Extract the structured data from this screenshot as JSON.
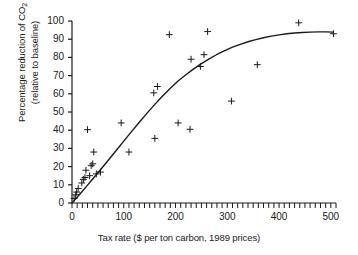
{
  "chart_data": {
    "type": "scatter",
    "title": "",
    "xlabel": "Tax rate ($ per ton carbon, 1989 prices)",
    "ylabel_line1": "Percentage reduction of CO",
    "ylabel_sub": "2",
    "ylabel_line2": "(relative to baseline)",
    "xlim": [
      0,
      510
    ],
    "ylim": [
      0,
      100
    ],
    "xticks": [
      0,
      100,
      200,
      300,
      400,
      500
    ],
    "xtick_labels": [
      "0",
      "100",
      "200",
      "300",
      "400",
      "500"
    ],
    "x_minor_tick_step": 10,
    "yticks": [
      0,
      10,
      20,
      30,
      40,
      50,
      60,
      70,
      80,
      90,
      100
    ],
    "ytick_labels": [
      "0",
      "10",
      "20",
      "30",
      "40",
      "50",
      "60",
      "70",
      "80",
      "90",
      "100"
    ],
    "grid": false,
    "legend": "none",
    "marker": "plus",
    "marker_color": "#1a1a1a",
    "line_color": "#1a1a1a",
    "axis_color": "#1a1a1a",
    "points": [
      [
        4,
        2.5
      ],
      [
        7,
        4.5
      ],
      [
        9,
        6.0
      ],
      [
        12,
        8.0
      ],
      [
        19,
        11.0
      ],
      [
        22,
        13.0
      ],
      [
        25,
        14.0
      ],
      [
        27,
        18.0
      ],
      [
        30,
        40.3
      ],
      [
        34,
        15.0
      ],
      [
        37,
        20.5
      ],
      [
        40,
        21.5
      ],
      [
        42,
        28.0
      ],
      [
        47,
        16.0
      ],
      [
        55,
        17.0
      ],
      [
        95,
        44.0
      ],
      [
        110,
        28.0
      ],
      [
        158,
        60.5
      ],
      [
        160,
        35.5
      ],
      [
        165,
        64.0
      ],
      [
        188,
        92.5
      ],
      [
        205,
        44.0
      ],
      [
        228,
        40.5
      ],
      [
        230,
        79.0
      ],
      [
        248,
        75.0
      ],
      [
        255,
        81.5
      ],
      [
        262,
        94.2
      ],
      [
        308,
        56.0
      ],
      [
        358,
        76.0
      ],
      [
        438,
        99.0
      ],
      [
        505,
        93.0
      ]
    ],
    "fit_curve": [
      [
        0,
        0
      ],
      [
        10,
        3.2
      ],
      [
        20,
        6.5
      ],
      [
        30,
        9.8
      ],
      [
        40,
        13.2
      ],
      [
        55,
        18.3
      ],
      [
        70,
        23.5
      ],
      [
        85,
        28.7
      ],
      [
        100,
        34.0
      ],
      [
        115,
        39.2
      ],
      [
        130,
        44.4
      ],
      [
        145,
        49.4
      ],
      [
        160,
        54.2
      ],
      [
        175,
        58.8
      ],
      [
        190,
        63.1
      ],
      [
        205,
        67.0
      ],
      [
        220,
        70.5
      ],
      [
        235,
        73.7
      ],
      [
        250,
        76.6
      ],
      [
        265,
        79.2
      ],
      [
        280,
        81.6
      ],
      [
        295,
        83.7
      ],
      [
        310,
        85.6
      ],
      [
        325,
        87.2
      ],
      [
        340,
        88.6
      ],
      [
        355,
        89.8
      ],
      [
        370,
        90.8
      ],
      [
        385,
        91.7
      ],
      [
        400,
        92.4
      ],
      [
        415,
        93.0
      ],
      [
        430,
        93.4
      ],
      [
        445,
        93.7
      ],
      [
        460,
        93.9
      ],
      [
        475,
        94.0
      ],
      [
        490,
        94.0
      ],
      [
        505,
        93.9
      ]
    ]
  }
}
